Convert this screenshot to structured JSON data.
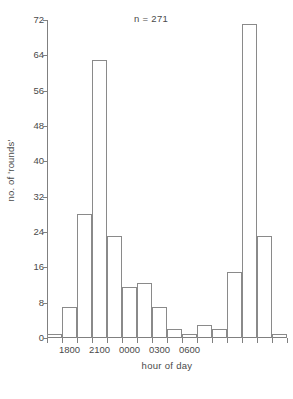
{
  "chart_data": {
    "type": "bar",
    "title": "",
    "subtitle": "",
    "xlabel": "hour of day",
    "ylabel": "no. of 'rounds'",
    "annotation": "n = 271",
    "grid": false,
    "legend": null,
    "ylim": [
      0,
      72
    ],
    "yticks": [
      0,
      8,
      16,
      24,
      32,
      40,
      48,
      56,
      64,
      72
    ],
    "ytick_labels": [
      "0",
      "8",
      "16",
      "24",
      "32",
      "40",
      "48",
      "56",
      "64",
      "72"
    ],
    "xtick_labels": [
      "1800",
      "2100",
      "0000",
      "0300",
      "0600"
    ],
    "xtick_positions": [
      1,
      3,
      5,
      7,
      9
    ],
    "bin_width_hours": 1.5,
    "bin_count": 16,
    "bin_starts": [
      "1630",
      "1800",
      "1930",
      "2100",
      "2230",
      "0000",
      "0130",
      "0300",
      "0430",
      "0600",
      "0730",
      "0900",
      "1030",
      "1200",
      "1330",
      "1500"
    ],
    "categories": [
      "1630",
      "1800",
      "1930",
      "2100",
      "2230",
      "0000",
      "0130",
      "0300",
      "0430",
      "0600",
      "0730",
      "0900",
      "1030",
      "1200",
      "1330",
      "1500"
    ],
    "values": [
      1,
      7,
      28,
      63,
      23,
      11.5,
      12.5,
      7,
      2,
      1,
      3,
      2,
      15,
      71,
      23,
      1
    ]
  },
  "axes": {
    "ylabel": "no. of 'rounds'",
    "xlabel": "hour of day",
    "annotation": "n = 271",
    "ytick_labels": [
      "72",
      "64",
      "56",
      "48",
      "40",
      "32",
      "24",
      "16",
      "8",
      "0"
    ],
    "xtick_labels": [
      "1800",
      "2100",
      "0000",
      "0300",
      "0600"
    ]
  }
}
